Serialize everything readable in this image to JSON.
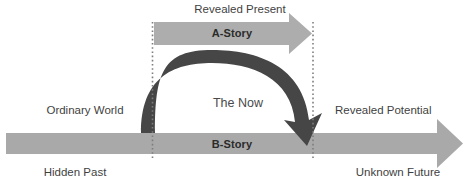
{
  "diagram": {
    "colors": {
      "light_gray_arrow": "#a8a8a8",
      "light_gray_arrow_alt": "#b0b0b0",
      "dark_arc": "#464646",
      "dotted_line": "#8a8a8a",
      "text": "#3f3f3f",
      "text_bold": "#2b2b2b",
      "background": "#ffffff"
    },
    "labels": {
      "revealed_present": "Revealed Present",
      "a_story": "A-Story",
      "the_now": "The Now",
      "ordinary_world": "Ordinary World",
      "revealed_potential": "Revealed Potential",
      "b_story": "B-Story",
      "hidden_past": "Hidden Past",
      "unknown_future": "Unknown Future"
    },
    "elements": {
      "a_story_arrow": "right-arrow-gray",
      "b_story_arrow": "right-arrow-gray",
      "now_arc_arrow": "curved-down-arrow-dark",
      "left_boundary": "dotted-vertical-line",
      "right_boundary": "dotted-vertical-line"
    }
  }
}
